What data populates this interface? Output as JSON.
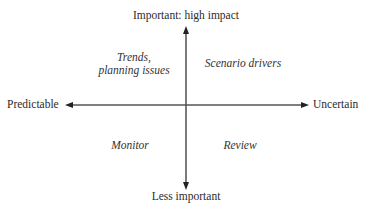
{
  "diagram": {
    "type": "2x2-matrix",
    "axes": {
      "top": "Important: high impact",
      "bottom": "Less important",
      "left": "Predictable",
      "right": "Uncertain"
    },
    "quadrants": {
      "top_left": {
        "line1": "Trends,",
        "line2": "planning issues"
      },
      "top_right": {
        "label": "Scenario drivers"
      },
      "bottom_left": {
        "label": "Monitor"
      },
      "bottom_right": {
        "label": "Review"
      }
    },
    "colors": {
      "axis_line": "#333333",
      "text": "#2b2b2b",
      "background": "#ffffff"
    }
  }
}
